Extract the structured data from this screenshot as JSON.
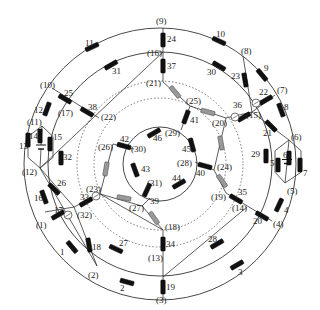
{
  "diagram": {
    "center": [
      160,
      164
    ],
    "rings": [
      {
        "id": "outer",
        "r": 136,
        "style": "solid"
      },
      {
        "id": "second",
        "r": 112,
        "style": "solid"
      },
      {
        "id": "dotted-outer",
        "r": 83,
        "style": "dotted"
      },
      {
        "id": "dotted-inner",
        "r": 66,
        "style": "dotted"
      },
      {
        "id": "inner",
        "r": 37,
        "style": "solid"
      }
    ],
    "colors": {
      "line": "#333333",
      "element_black": "#111111",
      "element_gray": "#999999",
      "dotted": "#555555"
    },
    "nodes": [
      {
        "id": "1",
        "label": "(1)",
        "x": 45,
        "y": 212,
        "lx": 36,
        "ly": 228
      },
      {
        "id": "2",
        "label": "(2)",
        "x": 97,
        "y": 266,
        "lx": 88,
        "ly": 278
      },
      {
        "id": "3",
        "label": "(3)",
        "x": 163,
        "y": 300,
        "lx": 156,
        "ly": 303
      },
      {
        "id": "4",
        "label": "(4)",
        "x": 272,
        "y": 221,
        "lx": 273,
        "ly": 227
      },
      {
        "id": "5",
        "label": "(5)",
        "x": 285,
        "y": 183,
        "lx": 287,
        "ly": 194
      },
      {
        "id": "6",
        "label": "(6)",
        "x": 289,
        "y": 140,
        "lx": 291,
        "ly": 140
      },
      {
        "id": "7",
        "label": "(7)",
        "x": 275,
        "y": 95,
        "lx": 277,
        "ly": 93
      },
      {
        "id": "8",
        "label": "(8)",
        "x": 243,
        "y": 56,
        "lx": 241,
        "ly": 54
      },
      {
        "id": "9",
        "label": "(9)",
        "x": 163,
        "y": 28,
        "lx": 156,
        "ly": 24
      },
      {
        "id": "10",
        "label": "(10)",
        "x": 52,
        "y": 88,
        "lx": 40,
        "ly": 88
      },
      {
        "id": "11",
        "label": "(11)",
        "x": 42,
        "y": 126,
        "lx": 27,
        "ly": 125
      },
      {
        "id": "12",
        "label": "(12)",
        "x": 40,
        "y": 168,
        "lx": 22,
        "ly": 175
      },
      {
        "id": "13",
        "label": "(13)",
        "x": 163,
        "y": 277,
        "lx": 148,
        "ly": 261
      },
      {
        "id": "14",
        "label": "(14)",
        "x": 247,
        "y": 207,
        "lx": 232,
        "ly": 211
      },
      {
        "id": "15",
        "label": "(15)",
        "x": 252,
        "y": 112,
        "lx": 246,
        "ly": 118
      },
      {
        "id": "16",
        "label": "(16)",
        "x": 163,
        "y": 52,
        "lx": 147,
        "ly": 56
      },
      {
        "id": "17",
        "label": "(17)",
        "x": 60,
        "y": 110,
        "lx": 58,
        "ly": 116
      },
      {
        "id": "18",
        "label": "(18)",
        "x": 163,
        "y": 230,
        "lx": 165,
        "ly": 230
      },
      {
        "id": "19",
        "label": "(19)",
        "x": 226,
        "y": 193,
        "lx": 211,
        "ly": 200
      },
      {
        "id": "20",
        "label": "(20)",
        "x": 226,
        "y": 118,
        "lx": 212,
        "ly": 126
      },
      {
        "id": "21",
        "label": "(21)",
        "x": 163,
        "y": 82,
        "lx": 146,
        "ly": 86
      },
      {
        "id": "22",
        "label": "(22)",
        "x": 99,
        "y": 118,
        "lx": 101,
        "ly": 120
      },
      {
        "id": "23",
        "label": "(23)",
        "x": 100,
        "y": 194,
        "lx": 86,
        "ly": 192
      },
      {
        "id": "24",
        "label": "(24)",
        "x": 214,
        "y": 170,
        "lx": 217,
        "ly": 170
      },
      {
        "id": "25",
        "label": "(25)",
        "x": 190,
        "y": 106,
        "lx": 186,
        "ly": 104
      },
      {
        "id": "26",
        "label": "(26)",
        "x": 113,
        "y": 144,
        "lx": 98,
        "ly": 150
      },
      {
        "id": "27",
        "label": "(27)",
        "x": 142,
        "y": 206,
        "lx": 129,
        "ly": 211
      },
      {
        "id": "28",
        "label": "(28)",
        "x": 195,
        "y": 162,
        "lx": 177,
        "ly": 166
      },
      {
        "id": "29",
        "label": "(29)",
        "x": 181,
        "y": 130,
        "lx": 165,
        "ly": 136
      },
      {
        "id": "30",
        "label": "(30)",
        "x": 134,
        "y": 149,
        "lx": 131,
        "ly": 152
      },
      {
        "id": "31",
        "label": "(31)",
        "x": 150,
        "y": 198,
        "lx": 147,
        "ly": 186
      },
      {
        "id": "32",
        "label": "(32)",
        "x": 74,
        "y": 207,
        "lx": 77,
        "ly": 218
      },
      {
        "id": "33",
        "label": "",
        "x": 96,
        "y": 196,
        "lx": 0,
        "ly": 0
      }
    ],
    "elements": [
      {
        "id": "1",
        "x": 72,
        "y": 247,
        "angle": 50,
        "color": "black",
        "lx": 60,
        "ly": 255
      },
      {
        "id": "2",
        "x": 127,
        "y": 282,
        "angle": 15,
        "color": "black",
        "lx": 120,
        "ly": 291
      },
      {
        "id": "3",
        "x": 237,
        "y": 265,
        "angle": -30,
        "color": "black",
        "lx": 238,
        "ly": 275
      },
      {
        "id": "4",
        "x": 279,
        "y": 205,
        "angle": -65,
        "color": "black",
        "lx": 284,
        "ly": 213
      },
      {
        "id": "5",
        "x": 278,
        "y": 165,
        "angle": 90,
        "color": "black",
        "lx": 270,
        "ly": 166
      },
      {
        "id": "6",
        "x": 289,
        "y": 158,
        "angle": 90,
        "color": "black",
        "lx": 283,
        "ly": 158
      },
      {
        "id": "7",
        "x": 300,
        "y": 165,
        "angle": 90,
        "color": "black",
        "lx": 303,
        "ly": 176
      },
      {
        "id": "8",
        "x": 281,
        "y": 110,
        "angle": 70,
        "color": "black",
        "lx": 284,
        "ly": 110
      },
      {
        "id": "9",
        "x": 262,
        "y": 75,
        "angle": 50,
        "color": "black",
        "lx": 264,
        "ly": 71
      },
      {
        "id": "10",
        "x": 219,
        "y": 41,
        "angle": 25,
        "color": "black",
        "lx": 216,
        "ly": 37
      },
      {
        "id": "11",
        "x": 92,
        "y": 47,
        "angle": -25,
        "color": "black",
        "lx": 85,
        "ly": 46
      },
      {
        "id": "12",
        "x": 47,
        "y": 109,
        "angle": -70,
        "color": "black",
        "lx": 34,
        "ly": 113
      },
      {
        "id": "13",
        "x": 28,
        "y": 140,
        "angle": 90,
        "color": "black",
        "lx": 19,
        "ly": 149
      },
      {
        "id": "14",
        "x": 40,
        "y": 136,
        "angle": 90,
        "color": "black",
        "lx": 29,
        "ly": 139
      },
      {
        "id": "15",
        "x": 50,
        "y": 144,
        "angle": 90,
        "color": "black",
        "lx": 53,
        "ly": 140
      },
      {
        "id": "16",
        "x": 44,
        "y": 197,
        "angle": 70,
        "color": "black",
        "lx": 34,
        "ly": 201
      },
      {
        "id": "17",
        "x": 58,
        "y": 215,
        "angle": -30,
        "color": "black",
        "lx": 54,
        "ly": 213
      },
      {
        "id": "18",
        "x": 89,
        "y": 245,
        "angle": 80,
        "color": "black",
        "lx": 92,
        "ly": 250
      },
      {
        "id": "19",
        "x": 163,
        "y": 287,
        "angle": 90,
        "color": "black",
        "lx": 166,
        "ly": 290
      },
      {
        "id": "20",
        "x": 262,
        "y": 216,
        "angle": 30,
        "color": "black",
        "lx": 253,
        "ly": 224
      },
      {
        "id": "21",
        "x": 271,
        "y": 126,
        "angle": 45,
        "color": "black",
        "lx": 263,
        "ly": 136
      },
      {
        "id": "22",
        "x": 266,
        "y": 100,
        "angle": -30,
        "color": "black",
        "lx": 259,
        "ly": 95
      },
      {
        "id": "23",
        "x": 245,
        "y": 80,
        "angle": 80,
        "color": "black",
        "lx": 231,
        "ly": 79
      },
      {
        "id": "24",
        "x": 163,
        "y": 40,
        "angle": 90,
        "color": "black",
        "lx": 167,
        "ly": 42
      },
      {
        "id": "25",
        "x": 65,
        "y": 99,
        "angle": 30,
        "color": "black",
        "lx": 64,
        "ly": 96
      },
      {
        "id": "26",
        "x": 54,
        "y": 189,
        "angle": 45,
        "color": "black",
        "lx": 57,
        "ly": 186
      },
      {
        "id": "27",
        "x": 116,
        "y": 249,
        "angle": 25,
        "color": "black",
        "lx": 119,
        "ly": 246
      },
      {
        "id": "28",
        "x": 217,
        "y": 244,
        "angle": -30,
        "color": "black",
        "lx": 208,
        "ly": 242
      },
      {
        "id": "29",
        "x": 266,
        "y": 156,
        "angle": 90,
        "color": "black",
        "lx": 251,
        "ly": 157
      },
      {
        "id": "30",
        "x": 219,
        "y": 66,
        "angle": 30,
        "color": "black",
        "lx": 207,
        "ly": 75
      },
      {
        "id": "31",
        "x": 111,
        "y": 65,
        "angle": -30,
        "color": "black",
        "lx": 112,
        "ly": 74
      },
      {
        "id": "32",
        "x": 61,
        "y": 158,
        "angle": 90,
        "color": "black",
        "lx": 63,
        "ly": 160
      },
      {
        "id": "33",
        "x": 86,
        "y": 202,
        "angle": -30,
        "color": "black",
        "lx": 80,
        "ly": 200
      },
      {
        "id": "34",
        "x": 163,
        "y": 244,
        "angle": 90,
        "color": "black",
        "lx": 166,
        "ly": 247
      },
      {
        "id": "35",
        "x": 236,
        "y": 199,
        "angle": 30,
        "color": "black",
        "lx": 238,
        "ly": 195
      },
      {
        "id": "36",
        "x": 244,
        "y": 117,
        "angle": -30,
        "color": "black",
        "lx": 233,
        "ly": 108
      },
      {
        "id": "37",
        "x": 163,
        "y": 66,
        "angle": 90,
        "color": "black",
        "lx": 167,
        "ly": 69
      },
      {
        "id": "38",
        "x": 87,
        "y": 112,
        "angle": 30,
        "color": "black",
        "lx": 88,
        "ly": 110
      },
      {
        "id": "39",
        "x": 147,
        "y": 190,
        "angle": -65,
        "color": "black",
        "lx": 150,
        "ly": 204
      },
      {
        "id": "40",
        "x": 205,
        "y": 166,
        "angle": 15,
        "color": "black",
        "lx": 196,
        "ly": 176
      },
      {
        "id": "41",
        "x": 186,
        "y": 117,
        "angle": -70,
        "color": "black",
        "lx": 190,
        "ly": 123
      },
      {
        "id": "42",
        "x": 124,
        "y": 146,
        "angle": 15,
        "color": "black",
        "lx": 120,
        "ly": 142
      },
      {
        "id": "43",
        "x": 135,
        "y": 170,
        "angle": 70,
        "color": "black",
        "lx": 141,
        "ly": 172
      },
      {
        "id": "44",
        "x": 179,
        "y": 184,
        "angle": -30,
        "color": "black",
        "lx": 172,
        "ly": 181
      },
      {
        "id": "45",
        "x": 192,
        "y": 145,
        "angle": 75,
        "color": "black",
        "lx": 182,
        "ly": 152
      },
      {
        "id": "46",
        "x": 154,
        "y": 133,
        "angle": -30,
        "color": "black",
        "lx": 153,
        "ly": 141
      },
      {
        "id": "g1",
        "x": 175,
        "y": 92,
        "angle": 50,
        "color": "gray"
      },
      {
        "id": "g2",
        "x": 208,
        "y": 112,
        "angle": 15,
        "color": "gray"
      },
      {
        "id": "g3",
        "x": 221,
        "y": 143,
        "angle": 80,
        "color": "gray"
      },
      {
        "id": "g4",
        "x": 222,
        "y": 181,
        "angle": 55,
        "color": "gray"
      },
      {
        "id": "g5",
        "x": 106,
        "y": 169,
        "angle": -80,
        "color": "gray"
      },
      {
        "id": "g6",
        "x": 124,
        "y": 198,
        "angle": 10,
        "color": "gray"
      },
      {
        "id": "g7",
        "x": 154,
        "y": 218,
        "angle": 55,
        "color": "gray"
      }
    ],
    "switches": [
      {
        "x": 68,
        "y": 215
      },
      {
        "x": 96,
        "y": 196
      },
      {
        "x": 235,
        "y": 117
      },
      {
        "x": 256,
        "y": 103
      }
    ],
    "sources": [
      {
        "id": "left",
        "top": [
          42,
          126
        ],
        "bottom": [
          40,
          168
        ],
        "left_x": 28,
        "right_x": 53
      },
      {
        "id": "right",
        "top": [
          289,
          140
        ],
        "bottom": [
          285,
          183
        ],
        "left_x": 275,
        "right_x": 301
      }
    ]
  }
}
